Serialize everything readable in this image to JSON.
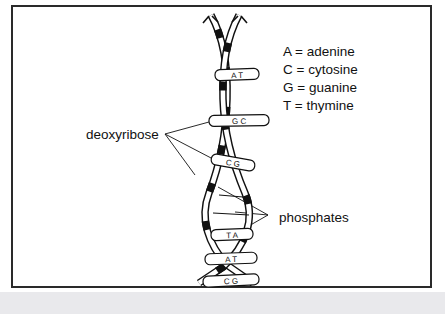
{
  "figure": {
    "panel_border_color": "#2a2a2a",
    "background_color": "#ffffff",
    "strip_color": "#e9e9ec",
    "ink_color": "#111111"
  },
  "legend": {
    "rows": [
      {
        "symbol": "A",
        "equals": "=",
        "name": "adenine",
        "text": "A = adenine"
      },
      {
        "symbol": "C",
        "equals": "=",
        "name": "cytosine",
        "text": "C = cytosine"
      },
      {
        "symbol": "G",
        "equals": "=",
        "name": "guanine",
        "text": "G = guanine"
      },
      {
        "symbol": "T",
        "equals": "=",
        "name": "thymine",
        "text": "T = thymine"
      }
    ]
  },
  "callouts": {
    "deoxyribose": "deoxyribose",
    "phosphates": "phosphates"
  },
  "base_pairs": [
    {
      "index": 1,
      "left": "A",
      "right": "T",
      "text": "A  T"
    },
    {
      "index": 2,
      "left": "G",
      "right": "C",
      "text": "G  C"
    },
    {
      "index": 3,
      "left": "C",
      "right": "G",
      "text": "C  G"
    },
    {
      "index": 4,
      "left": "T",
      "right": "A",
      "text": "T  A"
    },
    {
      "index": 5,
      "left": "A",
      "right": "T",
      "text": "A  T"
    },
    {
      "index": 6,
      "left": "C",
      "right": "G",
      "text": "C  G"
    }
  ]
}
